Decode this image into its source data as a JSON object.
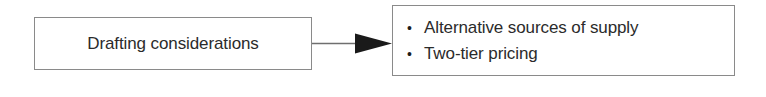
{
  "diagram": {
    "type": "flow-diagram",
    "background_color": "#ffffff",
    "border_color": "#8a8a8a",
    "text_color": "#2b2b2b",
    "arrow_color": "#1a1a1a",
    "source": {
      "label": "Drafting considerations"
    },
    "connector": {
      "icon": "arrow-right-icon",
      "direction": "left-to-right"
    },
    "outcome": {
      "bullet_marker": "•",
      "items": [
        {
          "text": "Alternative sources of supply"
        },
        {
          "text": "Two-tier pricing"
        }
      ]
    }
  }
}
